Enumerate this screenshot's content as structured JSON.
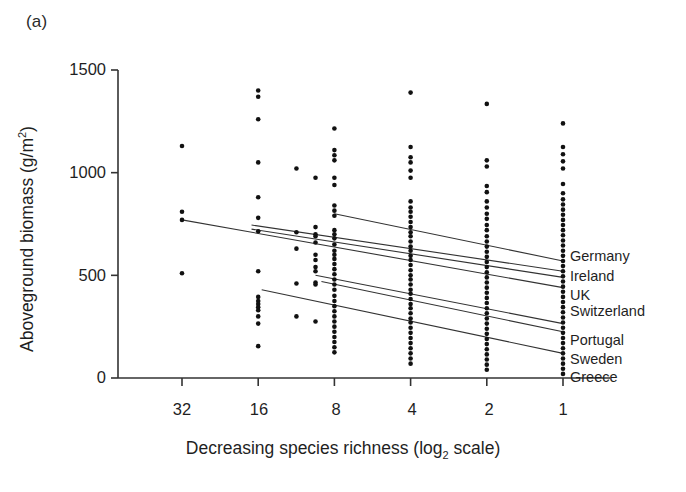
{
  "figure": {
    "panel_label": "(a)",
    "axes": {
      "ylabel_main": "Aboveground biomass (g/m",
      "ylabel_sup": "2",
      "ylabel_tail": ")",
      "xlabel_main": "Decreasing species richness (log",
      "xlabel_sub": "2",
      "xlabel_tail": " scale)"
    }
  },
  "chart_data": {
    "type": "scatter",
    "title": "(a)",
    "xlabel": "Decreasing species richness (log2 scale)",
    "ylabel": "Aboveground biomass (g/m2)",
    "xlabel_display": "Decreasing species richness (log₂ scale)",
    "ylabel_display": "Aboveground biomass (g/m²)",
    "grid": false,
    "legend_position": "right-inline-at-x1",
    "x_scale": "log2-decreasing",
    "x_tick_labels": [
      "32",
      "16",
      "8",
      "4",
      "2",
      "1"
    ],
    "x_tick_values": [
      32,
      16,
      8,
      4,
      2,
      1
    ],
    "y_tick_labels": [
      "0",
      "500",
      "1000",
      "1500"
    ],
    "y_tick_values": [
      0,
      500,
      1000,
      1500
    ],
    "ylim": [
      0,
      1500
    ],
    "xlim_log2": [
      5.6,
      0.0
    ],
    "series": [
      {
        "name": "Germany",
        "line": {
          "x_start": 8,
          "y_start": 800,
          "x_end": 1,
          "y_end": 570
        }
      },
      {
        "name": "Ireland",
        "line": {
          "x_start": 17,
          "y_start": 745,
          "x_end": 1,
          "y_end": 520
        }
      },
      {
        "name": "UK",
        "line": {
          "x_start": 17,
          "y_start": 725,
          "x_end": 1,
          "y_end": 490
        }
      },
      {
        "name": "Switzerland",
        "line": {
          "x_start": 32,
          "y_start": 770,
          "x_end": 1,
          "y_end": 440
        }
      },
      {
        "name": "Portugal",
        "line": {
          "x_start": 9.5,
          "y_start": 500,
          "x_end": 1,
          "y_end": 265
        }
      },
      {
        "name": "Sweden",
        "line": {
          "x_start": 9.0,
          "y_start": 470,
          "x_end": 1,
          "y_end": 225
        }
      },
      {
        "name": "Greece",
        "line": {
          "x_start": 15.5,
          "y_start": 430,
          "x_end": 1,
          "y_end": 120
        }
      }
    ],
    "points_by_x": {
      "32": [
        1130,
        810,
        770,
        510
      ],
      "16": [
        1400,
        1370,
        1260,
        1050,
        880,
        780,
        715,
        520,
        395,
        375,
        360,
        345,
        330,
        300,
        265,
        155
      ],
      "11.3": [
        1020,
        710,
        630,
        460,
        300
      ],
      "9.5": [
        975,
        735,
        700,
        690,
        660,
        600,
        575,
        540,
        520,
        465,
        455,
        275
      ],
      "8": [
        1215,
        1110,
        1085,
        1060,
        975,
        940,
        840,
        815,
        790,
        720,
        700,
        680,
        650,
        620,
        600,
        580,
        555,
        530,
        505,
        480,
        455,
        430,
        400,
        375,
        350,
        325,
        300,
        275,
        250,
        225,
        200,
        175,
        150,
        125
      ],
      "4": [
        1390,
        1125,
        1075,
        1050,
        1010,
        975,
        860,
        830,
        810,
        785,
        760,
        735,
        710,
        690,
        665,
        640,
        620,
        595,
        575,
        550,
        525,
        500,
        480,
        455,
        430,
        410,
        385,
        360,
        340,
        315,
        290,
        270,
        245,
        220,
        195,
        170,
        145,
        120,
        95,
        70
      ],
      "2": [
        1335,
        1060,
        1030,
        935,
        905,
        860,
        830,
        800,
        775,
        745,
        720,
        690,
        665,
        640,
        615,
        590,
        565,
        540,
        515,
        490,
        465,
        440,
        415,
        390,
        365,
        340,
        315,
        290,
        265,
        240,
        215,
        190,
        165,
        140,
        115,
        90,
        65,
        40
      ],
      "1": [
        1240,
        1125,
        1090,
        1055,
        1020,
        945,
        900,
        870,
        845,
        820,
        795,
        770,
        745,
        720,
        695,
        670,
        645,
        620,
        595,
        570,
        545,
        520,
        495,
        470,
        445,
        420,
        395,
        370,
        345,
        320,
        295,
        270,
        245,
        220,
        195,
        170,
        145,
        120,
        95,
        70,
        45,
        20
      ]
    }
  },
  "labels": {
    "germany": "Germany",
    "ireland": "Ireland",
    "uk": "UK",
    "switzerland": "Switzerland",
    "portugal": "Portugal",
    "sweden": "Sweden",
    "greece": "Greece"
  },
  "colors": {
    "ink": "#1a1a1a",
    "axis": "#333333",
    "point": "#111111",
    "line": "#333333",
    "background": "#ffffff"
  }
}
